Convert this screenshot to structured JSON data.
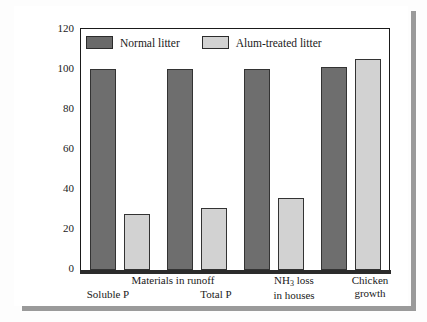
{
  "chart_data": {
    "type": "bar",
    "title": "",
    "xlabel": "",
    "ylabel": "Percentage of control (normal litter)",
    "ylim": [
      0,
      120
    ],
    "yticks": [
      0,
      20,
      40,
      60,
      80,
      100,
      120
    ],
    "ytick_labels": [
      "0",
      "20",
      "40",
      "60",
      "80",
      "100",
      "120"
    ],
    "grid": false,
    "legend_position": "top-left-inside",
    "categories": [
      "Soluble P",
      "Total P",
      "NH3 loss in houses",
      "Chicken growth"
    ],
    "group_headers": [
      {
        "label": "Materials in runoff",
        "spans": [
          "Soluble P",
          "Total P"
        ]
      }
    ],
    "series": [
      {
        "name": "Normal litter",
        "color": "#6e6e6e",
        "values": [
          100,
          100,
          100,
          101
        ]
      },
      {
        "name": "Alum-treated litter",
        "color": "#d2d2d2",
        "values": [
          28,
          31,
          36,
          105
        ]
      }
    ]
  },
  "legend": {
    "items": [
      {
        "label": "Normal litter",
        "swatch": "dark"
      },
      {
        "label": "Alum-treated litter",
        "swatch": "light"
      }
    ]
  },
  "axis": {
    "y_label": "Percentage of control (normal litter)",
    "y_ticks": [
      "120",
      "100",
      "80",
      "60",
      "40",
      "20",
      "0"
    ]
  },
  "x_axis": {
    "group_header": "Materials in runoff",
    "labels": [
      {
        "line1": "Soluble P",
        "line2": ""
      },
      {
        "line1": "Total P",
        "line2": ""
      },
      {
        "line1_pre": "NH",
        "line1_sub": "3",
        "line1_post": " loss",
        "line2": "in houses"
      },
      {
        "line1": "Chicken",
        "line2": "growth"
      }
    ]
  }
}
